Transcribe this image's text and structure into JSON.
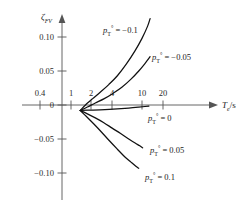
{
  "chart_data": {
    "type": "line",
    "title": "",
    "xlabel": "T_e/s",
    "ylabel": "zeta_FV",
    "xscale": "log",
    "xlim": [
      0.33,
      26
    ],
    "ylim": [
      -0.115,
      0.135
    ],
    "grid": false,
    "legend": "inline-annotations",
    "x_ticks": [
      {
        "value": 0.4,
        "label": "0.4"
      },
      {
        "value": 1,
        "label": "1"
      },
      {
        "value": 2,
        "label": "2"
      },
      {
        "value": 4,
        "label": "4"
      },
      {
        "value": 10,
        "label": "10"
      },
      {
        "value": 20,
        "label": "20"
      }
    ],
    "y_ticks": [
      {
        "value": 0.1,
        "label": "0.10"
      },
      {
        "value": 0.05,
        "label": "0.05"
      },
      {
        "value": 0.0,
        "label": "0"
      },
      {
        "value": -0.05,
        "label": "−0.05"
      },
      {
        "value": -0.1,
        "label": "−0.10"
      }
    ],
    "convergence_point": {
      "x": 1.35,
      "y": -0.008
    },
    "series": [
      {
        "name": "p_T_deg = -0.1",
        "parameter": -0.1,
        "x": [
          1.35,
          1.6,
          2.0,
          2.6,
          3.4,
          4.5,
          6.0,
          8.0,
          10.0,
          12.0,
          13.0
        ],
        "y": [
          -0.008,
          0.0,
          0.009,
          0.019,
          0.03,
          0.043,
          0.06,
          0.08,
          0.098,
          0.116,
          0.127
        ]
      },
      {
        "name": "p_T_deg = -0.05",
        "parameter": -0.05,
        "x": [
          1.35,
          1.7,
          2.2,
          2.9,
          3.9,
          5.2,
          7.0,
          9.0,
          11.0,
          13.0
        ],
        "y": [
          -0.008,
          -0.003,
          0.003,
          0.009,
          0.017,
          0.026,
          0.038,
          0.05,
          0.061,
          0.071
        ]
      },
      {
        "name": "p_T_deg = 0",
        "parameter": 0.0,
        "x": [
          1.35,
          2.0,
          3.0,
          4.5,
          6.5,
          9.0,
          11.0,
          12.5
        ],
        "y": [
          -0.008,
          -0.0075,
          -0.0068,
          -0.0058,
          -0.0046,
          -0.0032,
          -0.0022,
          -0.0015
        ]
      },
      {
        "name": "p_T_deg = 0.05",
        "parameter": 0.05,
        "x": [
          1.35,
          1.7,
          2.2,
          2.9,
          3.8,
          5.0,
          6.5,
          8.0,
          9.3,
          10.2
        ],
        "y": [
          -0.008,
          -0.013,
          -0.019,
          -0.026,
          -0.034,
          -0.042,
          -0.05,
          -0.056,
          -0.06,
          -0.063
        ]
      },
      {
        "name": "p_T_deg = 0.1",
        "parameter": 0.1,
        "x": [
          1.35,
          1.65,
          2.1,
          2.7,
          3.5,
          4.5,
          5.7,
          7.0,
          8.2,
          9.0
        ],
        "y": [
          -0.008,
          -0.017,
          -0.028,
          -0.04,
          -0.053,
          -0.065,
          -0.076,
          -0.084,
          -0.09,
          -0.093
        ]
      }
    ],
    "annotations": [
      {
        "id": "label-neg-0-1",
        "base": "p",
        "sub": "T",
        "sup": "°",
        "eq": " = −0.1",
        "x_px": 103,
        "y_px": 33
      },
      {
        "id": "label-neg-0-05",
        "base": "p",
        "sub": "T",
        "sup": "°",
        "eq": " = −0.05",
        "x_px": 152,
        "y_px": 60
      },
      {
        "id": "label-zero",
        "base": "p",
        "sub": "T",
        "sup": "°",
        "eq": " = 0",
        "x_px": 148,
        "y_px": 121
      },
      {
        "id": "label-pos-0-05",
        "base": "p",
        "sub": "T",
        "sup": "°",
        "eq": " = 0.05",
        "x_px": 150,
        "y_px": 153
      },
      {
        "id": "label-pos-0-1",
        "base": "p",
        "sub": "T",
        "sup": "°",
        "eq": " = 0.1",
        "x_px": 145,
        "y_px": 180
      }
    ],
    "axis_titles": {
      "y": {
        "base": "ζ",
        "sub": "FV"
      },
      "x": {
        "base": "T",
        "sub": "e",
        "rest": "/s"
      }
    }
  }
}
